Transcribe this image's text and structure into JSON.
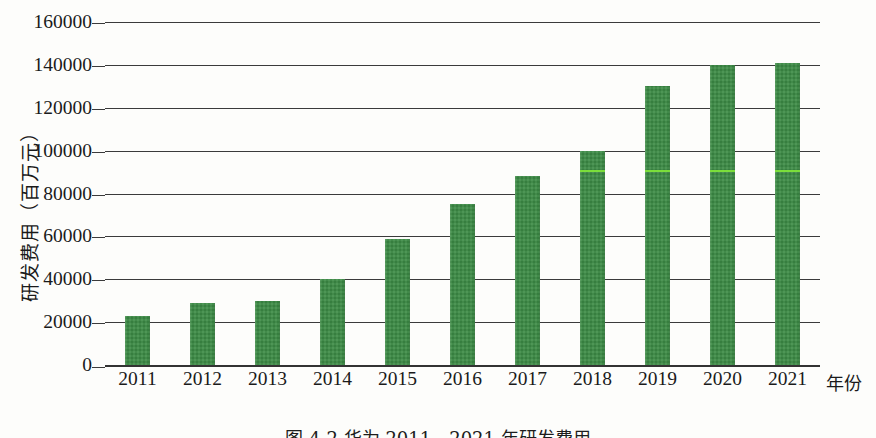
{
  "figure": {
    "caption": "图 4-2  华为 2011—2021 年研发费用",
    "axis_title_y": "研发费用（百万元）",
    "axis_title_x": "年份",
    "bar_color": "#3c8b45",
    "grid_color": "#3b3b3b",
    "scan_streak_color": "#7ee33a"
  },
  "chart_data": {
    "type": "bar",
    "title": "图 4-2  华为 2011—2021 年研发费用",
    "xlabel": "年份",
    "ylabel": "研发费用（百万元）",
    "ylim": [
      0,
      160000
    ],
    "ytick_step": 20000,
    "grid": true,
    "legend": null,
    "categories": [
      "2011",
      "2012",
      "2013",
      "2014",
      "2015",
      "2016",
      "2017",
      "2018",
      "2019",
      "2020",
      "2021"
    ],
    "values": [
      23000,
      29000,
      30000,
      40000,
      59000,
      75000,
      88000,
      100000,
      130000,
      140000,
      141000
    ],
    "ytick_labels": [
      "0",
      "20000",
      "40000",
      "60000",
      "80000",
      "100000",
      "120000",
      "140000",
      "160000"
    ],
    "ytick_values": [
      0,
      20000,
      40000,
      60000,
      80000,
      100000,
      120000,
      140000,
      160000
    ]
  }
}
